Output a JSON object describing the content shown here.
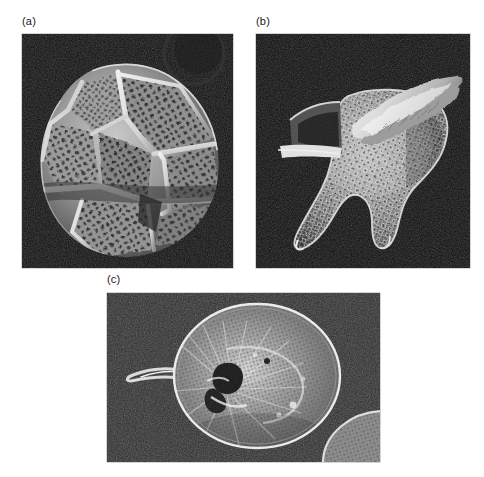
{
  "figure": {
    "background_color": "#ffffff",
    "width": 484,
    "height": 477,
    "caption_style": "lettered-panels",
    "panels": [
      {
        "label": "(a)",
        "name": "panel-a",
        "subject": "armored dinoflagellate thecal plates, scanning electron micrograph",
        "image_type": "scanning-electron-micrograph",
        "background_color": "#0d0d0d",
        "specimen_color": "#cfcfcf",
        "description": "Whole cell in oblique view showing polygonal thecal plates separated by raised sutures, each plate densely perforated with trichocyst pores; cingulum groove runs across the mid-cell.",
        "x": 22,
        "y": 34,
        "width": 211,
        "height": 234
      },
      {
        "label": "(b)",
        "name": "panel-b",
        "subject": "horned dinoflagellate theca with apical and antapical horns, scanning electron micrograph",
        "image_type": "scanning-electron-micrograph",
        "background_color": "#0c0c0c",
        "specimen_color": "#c8c8c8",
        "description": "Lateral view of a reticulate-pored theca bearing two tapering antapical horns and a detached elongate cingular plate lying above the cell body.",
        "x": 256,
        "y": 34,
        "width": 214,
        "height": 234
      },
      {
        "label": "(c)",
        "name": "panel-c",
        "subject": "unarmored dinoflagellate cell with emergent flagellum, light micrograph",
        "image_type": "light-micrograph",
        "background_color": "#2a2a2a",
        "specimen_color": "#d8d8d8",
        "description": "Rounded ovoid cell with granular cytoplasm, a dark apical pore region, radiating internal striae and a long flagellum extending to the left; a second partial cell appears at the lower right corner.",
        "x": 107,
        "y": 293,
        "width": 273,
        "height": 169
      }
    ]
  }
}
